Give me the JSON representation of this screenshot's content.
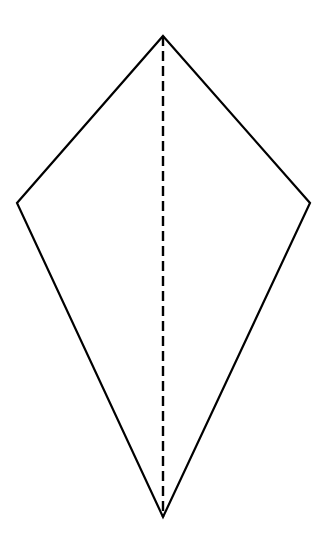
{
  "canvas": {
    "width": 333,
    "height": 552,
    "background_color": "#ffffff"
  },
  "figure": {
    "name": "kite",
    "shape_type": "kite-quadrilateral",
    "outline_color": "#000000",
    "outline_width": 2.2,
    "fill_color": "none",
    "symmetry_axis": {
      "name": "axis-of-symmetry",
      "style": "dashed",
      "color": "#000000",
      "width": 2.4,
      "dash_length": 10,
      "dash_gap": 5,
      "from": "top-vertex",
      "to": "bottom-vertex"
    },
    "vertices": [
      {
        "label": "top-vertex",
        "x": 163,
        "y": 36
      },
      {
        "label": "right-vertex",
        "x": 310,
        "y": 203
      },
      {
        "label": "bottom-vertex",
        "x": 163,
        "y": 517
      },
      {
        "label": "left-vertex",
        "x": 17,
        "y": 203
      }
    ],
    "edges": [
      {
        "label": "upper-left-edge",
        "from": "top-vertex",
        "to": "left-vertex"
      },
      {
        "label": "upper-right-edge",
        "from": "top-vertex",
        "to": "right-vertex"
      },
      {
        "label": "lower-right-edge",
        "from": "right-vertex",
        "to": "bottom-vertex"
      },
      {
        "label": "lower-left-edge",
        "from": "left-vertex",
        "to": "bottom-vertex"
      }
    ],
    "polygon_points": "163,36 310,203 163,517 17,203"
  },
  "chart_data": {
    "type": "scatter",
    "title": "",
    "xlabel": "",
    "ylabel": "",
    "xlim": [
      0,
      333
    ],
    "ylim": [
      0,
      552
    ],
    "grid": false,
    "legend": "none",
    "annotations": [],
    "series": [
      {
        "name": "kite-outline",
        "mode": "closed-polygon",
        "x": [
          163,
          310,
          163,
          17
        ],
        "y": [
          36,
          203,
          517,
          203
        ]
      },
      {
        "name": "axis-of-symmetry",
        "mode": "dashed-line",
        "x": [
          163,
          163
        ],
        "y": [
          36,
          517
        ]
      }
    ]
  }
}
